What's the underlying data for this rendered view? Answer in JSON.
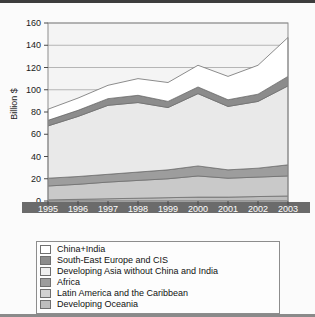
{
  "chart_data": {
    "type": "area",
    "title": "",
    "subtitle": "",
    "xlabel": "",
    "ylabel": "Billion $",
    "categories": [
      "1995",
      "1996",
      "1997",
      "1998",
      "1999",
      "2000",
      "2001",
      "2002",
      "2003"
    ],
    "x": [
      1995,
      1996,
      1997,
      1998,
      1999,
      2000,
      2001,
      2002,
      2003
    ],
    "ylim": [
      0,
      160
    ],
    "yticks": [
      0,
      20,
      40,
      60,
      80,
      100,
      120,
      140,
      160
    ],
    "grid": true,
    "stacked": true,
    "legend_position": "bottom",
    "series": [
      {
        "name": "China+India",
        "color": "#ffffff",
        "values": [
          10.0,
          11.0,
          12.0,
          15.0,
          17.0,
          19.5,
          21.0,
          26.0,
          35.0
        ]
      },
      {
        "name": "South-East Europe and CIS",
        "color": "#8c8c8c",
        "values": [
          5.0,
          5.5,
          6.0,
          6.5,
          5.5,
          6.0,
          6.0,
          6.5,
          8.5
        ]
      },
      {
        "name": "Developing Asia without China and India",
        "color": "#e9e9e9",
        "values": [
          47.0,
          54.0,
          62.0,
          62.5,
          56.0,
          65.0,
          57.0,
          60.0,
          71.0
        ]
      },
      {
        "name": "Africa",
        "color": "#9d9d9d",
        "values": [
          7.0,
          7.0,
          7.0,
          7.5,
          8.0,
          9.0,
          7.5,
          8.0,
          10.0
        ]
      },
      {
        "name": "Latin America and the Caribbean",
        "color": "#c9c9c9",
        "values": [
          12.5,
          13.5,
          15.0,
          16.0,
          17.0,
          19.0,
          17.0,
          17.5,
          18.0
        ]
      },
      {
        "name": "Developing Oceania",
        "color": "#bdbdbd",
        "values": [
          1.0,
          1.5,
          2.0,
          2.5,
          3.0,
          3.5,
          3.5,
          4.0,
          4.5
        ]
      }
    ],
    "totals": [
      82.5,
      92.5,
      104.0,
      110.0,
      106.5,
      122.0,
      112.0,
      122.0,
      147.0
    ]
  },
  "legend": {
    "items": [
      {
        "label": "China+India",
        "color": "#ffffff"
      },
      {
        "label": "South-East Europe and CIS",
        "color": "#8c8c8c"
      },
      {
        "label": "Developing Asia without China and India",
        "color": "#efefef"
      },
      {
        "label": "Africa",
        "color": "#9d9d9d"
      },
      {
        "label": "Latin America and the Caribbean",
        "color": "#d2d2d2"
      },
      {
        "label": "Developing Oceania",
        "color": "#bdbdbd"
      }
    ]
  },
  "axis": {
    "y_title": "Billion $",
    "y_ticks": [
      "160",
      "140",
      "120",
      "100",
      "80",
      "60",
      "40",
      "20",
      "0"
    ],
    "x_ticks": [
      "1995",
      "1996",
      "1997",
      "1998",
      "1999",
      "2000",
      "2001",
      "2002",
      "2003"
    ]
  }
}
